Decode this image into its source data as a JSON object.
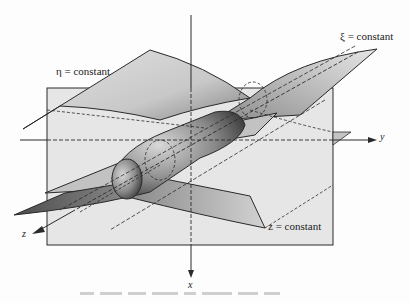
{
  "figure": {
    "labels": {
      "eta_surface": "η = constant",
      "xi_surface": "ξ = constant",
      "z_plane": "z = constant"
    },
    "axes": {
      "x": "x",
      "y": "y",
      "z": "z"
    },
    "colors": {
      "line": "#2a2a2a",
      "plane_fill": "#e4e4e4",
      "surface_light": "#d6d6d6",
      "surface_dark": "#6e6e6e",
      "background": "#fdfdfd"
    }
  }
}
